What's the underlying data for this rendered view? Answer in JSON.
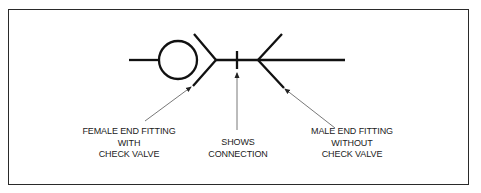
{
  "diagram": {
    "type": "hydraulic-quick-disconnect-symbol",
    "colors": {
      "line": "#111111",
      "leader": "#555555",
      "frame": "#2a2a2a",
      "text": "#222222"
    },
    "labels": {
      "female": {
        "lines": [
          "FEMALE END FITTING",
          "WITH",
          "CHECK VALVE"
        ]
      },
      "connection": {
        "lines": [
          "SHOWS",
          "CONNECTION"
        ]
      },
      "male": {
        "lines": [
          "MALE END FITTING",
          "WITHOUT",
          "CHECK VALVE"
        ]
      }
    },
    "symbols": [
      {
        "name": "check-valve",
        "shape": "circle"
      },
      {
        "name": "female-end-fitting",
        "shape": "chevron"
      },
      {
        "name": "connection-mark",
        "shape": "tick"
      },
      {
        "name": "male-end-fitting",
        "shape": "chevron"
      }
    ]
  }
}
